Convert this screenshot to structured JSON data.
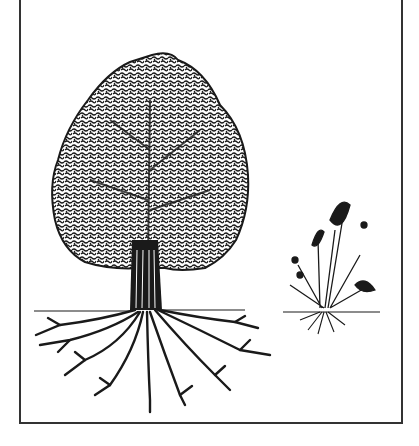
{
  "illustration": {
    "subjects": [
      "tree-with-root-system",
      "grass-plant-with-root-system"
    ],
    "style": "black-and-white-line-art",
    "colors": {
      "ink": "#1a1a1a",
      "background": "#ffffff",
      "frame": "#333333"
    }
  }
}
